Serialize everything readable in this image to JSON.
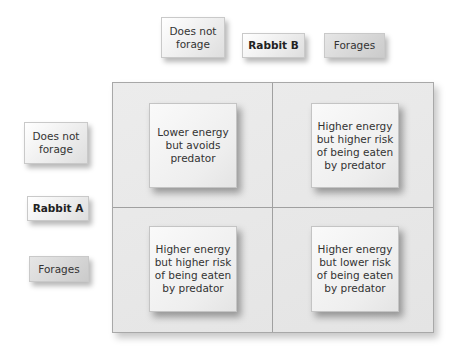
{
  "columns": {
    "player": "Rabbit B",
    "options": [
      "Does not forage",
      "Forages"
    ]
  },
  "rows": {
    "player": "Rabbit A",
    "options": [
      "Does not forage",
      "Forages"
    ]
  },
  "matrix": [
    [
      "Lower energy but avoids predator",
      "Higher energy but higher risk of being eaten by predator"
    ],
    [
      "Higher energy but higher risk of being eaten by predator",
      "Higher energy but lower risk of being eaten by predator"
    ]
  ]
}
